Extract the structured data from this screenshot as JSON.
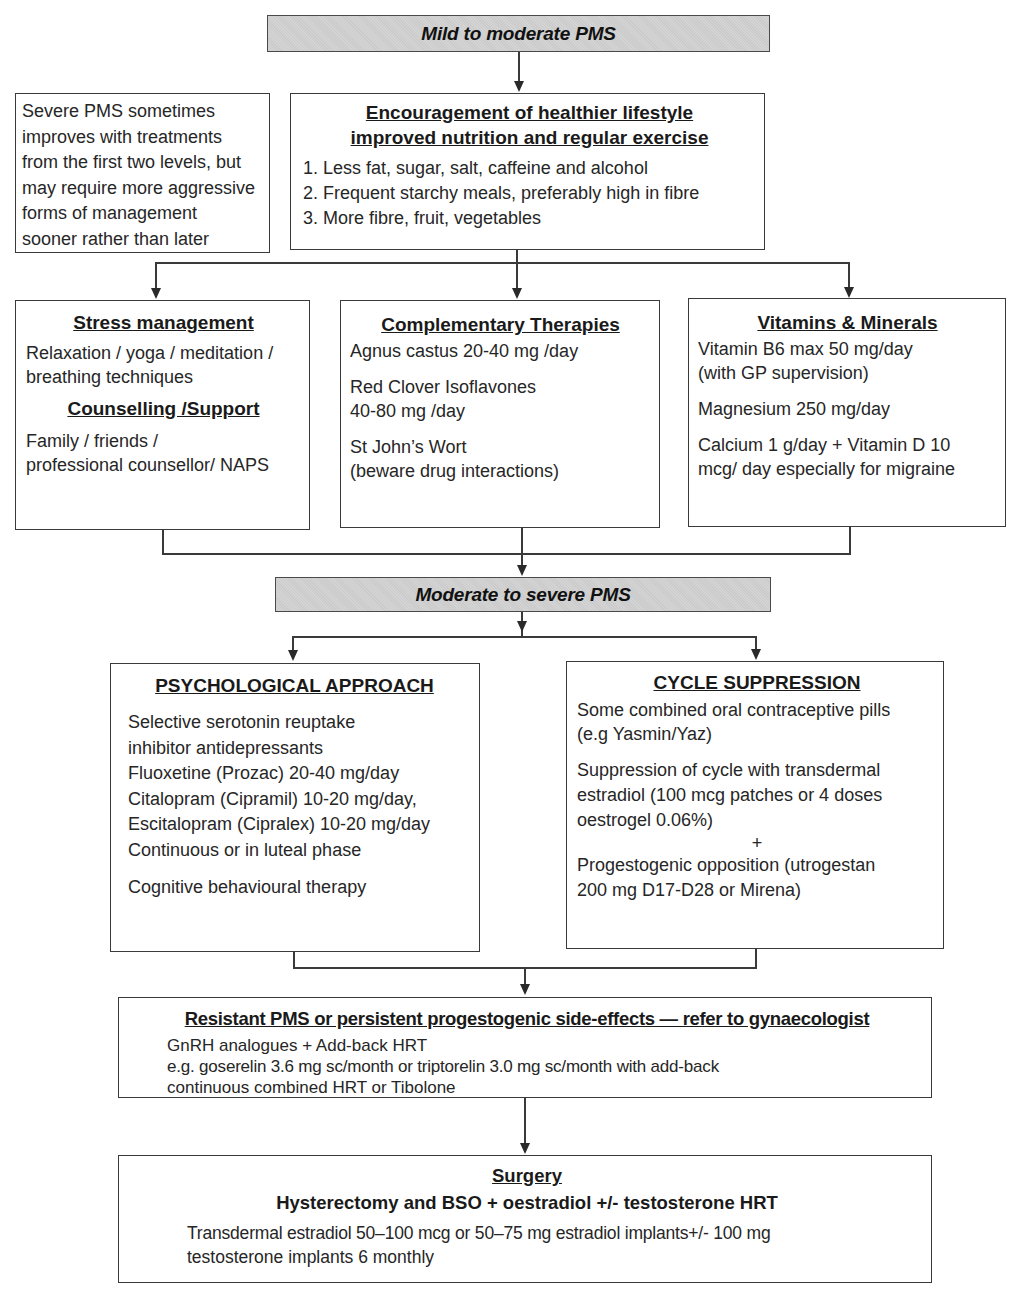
{
  "title_partial": "",
  "levels": {
    "mild_to_moderate": {
      "label": "Mild to moderate PMS"
    },
    "moderate_to_severe": {
      "label": "Moderate to severe PMS"
    }
  },
  "note": {
    "lines": [
      "Severe PMS sometimes",
      "improves with treatments",
      "from the first two levels, but",
      "may require more aggressive",
      "forms of management",
      "sooner rather than later"
    ]
  },
  "lifestyle": {
    "heading_line1": "Encouragement of healthier lifestyle",
    "heading_line2": "improved nutrition and regular exercise",
    "items": [
      "1. Less fat, sugar, salt, caffeine and alcohol",
      "2. Frequent starchy meals, preferably high in fibre",
      "3. More fibre, fruit, vegetables"
    ]
  },
  "stress": {
    "heading": "Stress management",
    "lines": [
      "Relaxation / yoga / meditation /",
      "breathing techniques"
    ],
    "subheading": "Counselling /Support",
    "sub_lines": [
      "Family / friends /",
      "professional counsellor/ NAPS"
    ]
  },
  "complementary": {
    "heading": "Complementary Therapies",
    "items": [
      [
        "Agnus castus 20-40 mg /day"
      ],
      [
        "Red Clover Isoflavones",
        "40-80 mg /day"
      ],
      [
        "St John’s Wort",
        "(beware drug interactions)"
      ]
    ]
  },
  "vitamins": {
    "heading": "Vitamins & Minerals",
    "items": [
      [
        "Vitamin B6 max 50 mg/day",
        "(with GP supervision)"
      ],
      [
        "Magnesium 250 mg/day"
      ],
      [
        "Calcium 1 g/day + Vitamin D 10",
        "mcg/ day especially for migraine"
      ]
    ]
  },
  "psychological": {
    "heading": "PSYCHOLOGICAL APPROACH",
    "lines": [
      "Selective serotonin reuptake",
      "inhibitor antidepressants",
      "Fluoxetine (Prozac) 20-40 mg/day",
      "Citalopram (Cipramil) 10-20 mg/day,",
      "Escitalopram (Cipralex) 10-20 mg/day",
      "Continuous or in luteal phase"
    ],
    "cbt": "Cognitive behavioural therapy"
  },
  "cycle": {
    "heading": "CYCLE SUPPRESSION",
    "coc_lines": [
      "Some combined oral contraceptive pills",
      "(e.g Yasmin/Yaz)"
    ],
    "transdermal_lines": [
      "Suppression of cycle with transdermal",
      "estradiol (100 mcg patches or 4 doses",
      "oestrogel 0.06%)"
    ],
    "plus": "+",
    "progest_lines": [
      "Progestogenic opposition (utrogestan",
      "200 mg D17-D28 or Mirena)"
    ]
  },
  "resistant": {
    "heading": "Resistant PMS or persistent progestogenic side-effects — refer to gynaecologist",
    "lines": [
      "GnRH analogues + Add-back HRT",
      "e.g. goserelin 3.6 mg sc/month or triptorelin 3.0 mg sc/month with add-back",
      "continuous combined HRT or Tibolone"
    ]
  },
  "surgery": {
    "heading": "Surgery",
    "subheading": "Hysterectomy and BSO + oestradiol +/- testosterone HRT",
    "lines": [
      "Transdermal estradiol 50–100 mcg or 50–75 mg estradiol implants+/- 100 mg",
      "testosterone implants 6 monthly"
    ]
  },
  "colors": {
    "level_fill": "#cfcfcf",
    "border": "#3a3a3a",
    "text": "#262626"
  }
}
